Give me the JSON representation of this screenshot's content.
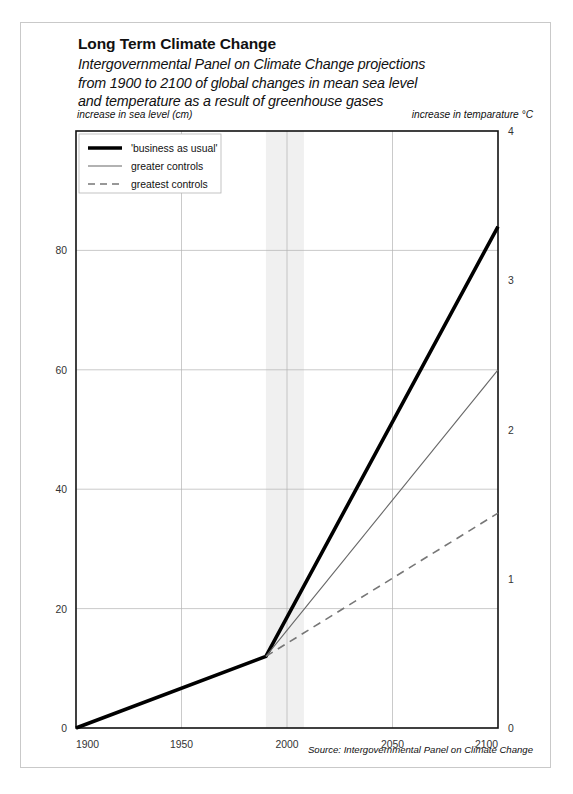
{
  "header": {
    "title": "Long Term Climate Change",
    "subtitle_lines": [
      "Intergovernmental Panel on Climate Change projections",
      "from 1900 to 2100 of global changes in mean sea level",
      "and temperature as a result of greenhouse gases"
    ],
    "left_axis_label": "increase in sea level (cm)",
    "right_axis_label": "increase in temparature °C"
  },
  "footer": {
    "source": "Source: Intergovernmental Panel on Climate Change"
  },
  "colors": {
    "frame": "#c9c9c9",
    "axis": "#111111",
    "grid": "#b3b3b3",
    "business_as_usual": "#000000",
    "greater_controls": "#666666",
    "greatest_controls": "#777777",
    "band": "#f0f0f0",
    "text": "#111111"
  },
  "chart_data": {
    "type": "line",
    "title": "Long Term Climate Change",
    "subtitle": "Intergovernmental Panel on Climate Change projections from 1900 to 2100 of global changes in mean sea level and temperature as a result of greenhouse gases",
    "xlabel": "",
    "ylabel": "increase in sea level (cm)",
    "y2label": "increase in temparature °C",
    "xlim": [
      1900,
      2100
    ],
    "ylim": [
      0,
      100
    ],
    "y2lim": [
      0,
      4
    ],
    "xticks": [
      1900,
      1950,
      2000,
      2050,
      2100
    ],
    "xticklabels": [
      "1900",
      "1950",
      "2000",
      "2050",
      "2100"
    ],
    "yticks": [
      0,
      20,
      40,
      60,
      80
    ],
    "yticklabels": [
      "0",
      "20",
      "40",
      "60",
      "80"
    ],
    "y2ticks": [
      0,
      1,
      2,
      3,
      4
    ],
    "y2ticklabels": [
      "0",
      "1",
      "2",
      "3",
      "4"
    ],
    "grid": true,
    "legend_position": "top-left",
    "shaded_band": {
      "x0": 1990,
      "x1": 2008,
      "label": ""
    },
    "series": [
      {
        "name": "'business as usual'",
        "style": "solid-thick",
        "color": "#000000",
        "x": [
          1900,
          1990,
          2100
        ],
        "values": [
          0,
          12,
          84
        ]
      },
      {
        "name": "greater controls",
        "style": "solid-thin",
        "color": "#666666",
        "x": [
          1990,
          2100
        ],
        "values": [
          12,
          60
        ]
      },
      {
        "name": "greatest controls",
        "style": "dashed",
        "color": "#777777",
        "x": [
          1990,
          2100
        ],
        "values": [
          12,
          36
        ]
      }
    ]
  },
  "legend": {
    "items": [
      {
        "label": "'business as usual'",
        "style": "solid-thick"
      },
      {
        "label": "greater controls",
        "style": "solid-thin"
      },
      {
        "label": "greatest controls",
        "style": "dashed"
      }
    ]
  }
}
